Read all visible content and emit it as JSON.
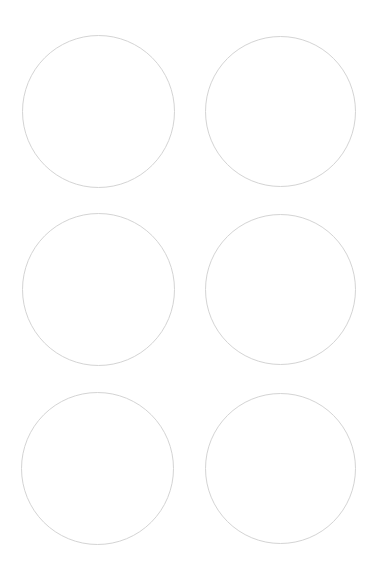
{
  "page": {
    "background": "#ffffff",
    "width": 377,
    "height": 574
  },
  "circles": {
    "stroke_color": "#d4d4d4",
    "stroke_width": 1,
    "items": [
      {
        "row": 1,
        "col": 1,
        "cx": 98,
        "cy": 111,
        "r": 76
      },
      {
        "row": 1,
        "col": 2,
        "cx": 280,
        "cy": 111,
        "r": 75
      },
      {
        "row": 2,
        "col": 1,
        "cx": 98,
        "cy": 289,
        "r": 76
      },
      {
        "row": 2,
        "col": 2,
        "cx": 280,
        "cy": 289,
        "r": 75
      },
      {
        "row": 3,
        "col": 1,
        "cx": 97,
        "cy": 468,
        "r": 76
      },
      {
        "row": 3,
        "col": 2,
        "cx": 280,
        "cy": 468,
        "r": 75
      }
    ]
  }
}
